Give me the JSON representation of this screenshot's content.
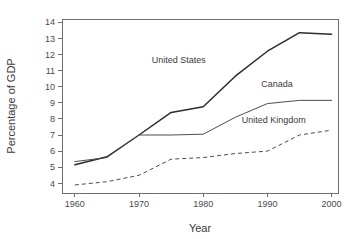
{
  "chart_data": {
    "type": "line",
    "title": "",
    "xlabel": "Year",
    "ylabel": "Percentage of GDP",
    "xlim": [
      1958,
      2001
    ],
    "ylim": [
      3.4,
      14.2
    ],
    "xticks": [
      1960,
      1970,
      1980,
      1990,
      2000
    ],
    "yticks": [
      4,
      5,
      6,
      7,
      8,
      9,
      10,
      11,
      12,
      13,
      14
    ],
    "grid": false,
    "legend_position": "inline-annotations",
    "x": [
      1960,
      1965,
      1970,
      1975,
      1980,
      1985,
      1990,
      1995,
      2000
    ],
    "series": [
      {
        "name": "United States",
        "style": "solid",
        "color": "#2b2b2b",
        "values": [
          5.15,
          5.65,
          7.0,
          8.4,
          8.75,
          10.65,
          12.2,
          13.35,
          13.25
        ]
      },
      {
        "name": "Canada",
        "style": "solid",
        "color": "#4d4d4d",
        "values": [
          5.35,
          5.6,
          7.0,
          7.0,
          7.05,
          8.1,
          8.95,
          9.15,
          9.15
        ]
      },
      {
        "name": "United Kingdom",
        "style": "dashed",
        "color": "#4d4d4d",
        "values": [
          3.9,
          4.1,
          4.5,
          5.5,
          5.6,
          5.85,
          6.0,
          7.0,
          7.3
        ]
      }
    ],
    "annotations": [
      {
        "text": "United States",
        "x": 1976.2,
        "y": 11.5
      },
      {
        "text": "Canada",
        "x": 1991.5,
        "y": 10.0
      },
      {
        "text": "United Kingdom",
        "x": 1991.0,
        "y": 7.75
      }
    ]
  }
}
